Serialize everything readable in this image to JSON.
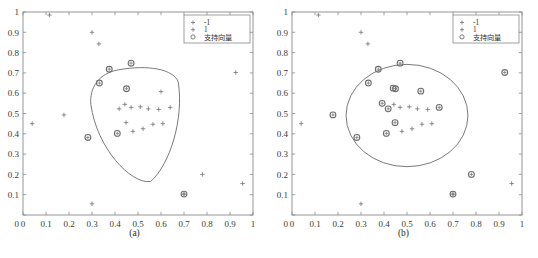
{
  "figure": {
    "caption": "",
    "panels": [
      {
        "id": "a",
        "sublabel": "(a)"
      },
      {
        "id": "b",
        "sublabel": "(b)"
      }
    ]
  },
  "legend": {
    "entries": [
      {
        "marker": "plus-marker",
        "label": "-1"
      },
      {
        "marker": "plus-marker",
        "label": "1"
      },
      {
        "marker": "circle-marker",
        "label": "支持向量"
      }
    ]
  },
  "colors": {
    "axis": "#8a8a8a",
    "tick_text": "#3a3a3a",
    "point": "#7a7a7a",
    "support_vector": "#6e6e6e",
    "contour": "#6b6b6b",
    "legend_border": "#8a8a8a",
    "background": "#ffffff"
  },
  "chart_data": [
    {
      "type": "scatter",
      "title": "(a)",
      "xlabel": "",
      "ylabel": "",
      "xlim": [
        0,
        1
      ],
      "ylim": [
        0,
        1
      ],
      "grid": false,
      "xticks": [
        "0",
        "0.1",
        "0.2",
        "0.3",
        "0.4",
        "0.5",
        "0.6",
        "0.7",
        "0.8",
        "0.9",
        "1"
      ],
      "yticks": [
        "0",
        "0.1",
        "0.2",
        "0.3",
        "0.4",
        "0.5",
        "0.6",
        "0.7",
        "0.8",
        "0.9",
        "1"
      ],
      "legend_position": "upper right",
      "series": [
        {
          "name": "-1",
          "marker": "+",
          "points": [
            [
              0.115,
              0.985
            ],
            [
              0.3,
              0.9
            ],
            [
              0.33,
              0.843
            ],
            [
              0.04,
              0.45
            ],
            [
              0.178,
              0.493
            ],
            [
              0.3,
              0.055
            ],
            [
              0.78,
              0.2
            ],
            [
              0.955,
              0.155
            ],
            [
              0.7,
              0.103
            ],
            [
              0.925,
              0.702
            ],
            [
              0.6,
              0.608
            ]
          ]
        },
        {
          "name": "1",
          "marker": "+",
          "points": [
            [
              0.443,
              0.545
            ],
            [
              0.47,
              0.53
            ],
            [
              0.51,
              0.533
            ],
            [
              0.545,
              0.523
            ],
            [
              0.59,
              0.52
            ],
            [
              0.64,
              0.53
            ],
            [
              0.478,
              0.412
            ],
            [
              0.522,
              0.425
            ],
            [
              0.565,
              0.447
            ],
            [
              0.608,
              0.45
            ],
            [
              0.418,
              0.523
            ],
            [
              0.448,
              0.455
            ]
          ]
        },
        {
          "name": "支持向量",
          "marker": "o",
          "points": [
            [
              0.375,
              0.718
            ],
            [
              0.332,
              0.65
            ],
            [
              0.47,
              0.748
            ],
            [
              0.41,
              0.402
            ],
            [
              0.282,
              0.382
            ],
            [
              0.7,
              0.103
            ],
            [
              0.45,
              0.622
            ]
          ]
        }
      ],
      "decision_boundary": {
        "shape": "rounded-triangle",
        "description": "Closed contour enclosing the class +1 cluster"
      }
    },
    {
      "type": "scatter",
      "title": "(b)",
      "xlabel": "",
      "ylabel": "",
      "xlim": [
        0,
        1
      ],
      "ylim": [
        0,
        1
      ],
      "grid": false,
      "xticks": [
        "0",
        "0.1",
        "0.2",
        "0.3",
        "0.4",
        "0.5",
        "0.6",
        "0.7",
        "0.8",
        "0.9",
        "1"
      ],
      "yticks": [
        "0",
        "0.1",
        "0.2",
        "0.3",
        "0.4",
        "0.5",
        "0.6",
        "0.7",
        "0.8",
        "0.9",
        "1"
      ],
      "legend_position": "upper right",
      "series": [
        {
          "name": "-1",
          "marker": "+",
          "points": [
            [
              0.115,
              0.985
            ],
            [
              0.3,
              0.9
            ],
            [
              0.33,
              0.843
            ],
            [
              0.04,
              0.45
            ],
            [
              0.3,
              0.055
            ],
            [
              0.955,
              0.155
            ],
            [
              0.7,
              0.103
            ]
          ]
        },
        {
          "name": "1",
          "marker": "+",
          "points": [
            [
              0.47,
              0.53
            ],
            [
              0.51,
              0.533
            ],
            [
              0.545,
              0.523
            ],
            [
              0.59,
              0.52
            ],
            [
              0.443,
              0.545
            ],
            [
              0.478,
              0.412
            ],
            [
              0.522,
              0.425
            ],
            [
              0.565,
              0.447
            ],
            [
              0.608,
              0.45
            ]
          ]
        },
        {
          "name": "支持向量",
          "marker": "o",
          "points": [
            [
              0.375,
              0.718
            ],
            [
              0.332,
              0.65
            ],
            [
              0.47,
              0.748
            ],
            [
              0.41,
              0.402
            ],
            [
              0.282,
              0.382
            ],
            [
              0.7,
              0.103
            ],
            [
              0.45,
              0.622
            ],
            [
              0.44,
              0.625
            ],
            [
              0.56,
              0.61
            ],
            [
              0.178,
              0.493
            ],
            [
              0.78,
              0.2
            ],
            [
              0.925,
              0.702
            ],
            [
              0.418,
              0.523
            ],
            [
              0.448,
              0.455
            ],
            [
              0.64,
              0.53
            ],
            [
              0.392,
              0.55
            ]
          ]
        }
      ],
      "decision_boundary": {
        "shape": "ellipse",
        "description": "Closed near-circular contour enclosing the class +1 cluster"
      }
    }
  ]
}
